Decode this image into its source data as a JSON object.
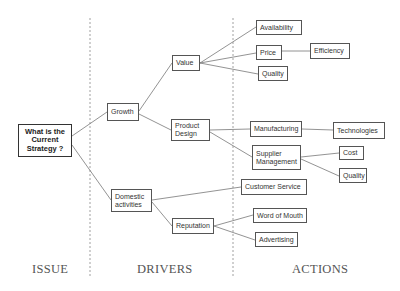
{
  "diagram": {
    "type": "issue-tree",
    "root": "What is the Current Strategy ?",
    "sections": {
      "issue": "ISSUE",
      "drivers": "DRIVERS",
      "actions": "ACTIONS"
    },
    "nodes": {
      "root": "What is the Current Strategy ?",
      "growth": "Growth",
      "domestic": "Domestic activities",
      "value": "Value",
      "product_design": "Product Design",
      "reputation": "Reputation",
      "availability": "Availability",
      "price": "Price",
      "efficiency": "Efficiency",
      "quality1": "Quality",
      "manufacturing": "Manufacturing",
      "technologies": "Technologies",
      "supplier": "Supplier Management",
      "cost": "Cost",
      "quality2": "Quality",
      "customer_service": "Customer Service",
      "word_of_mouth": "Word of Mouth",
      "advertising": "Advertising"
    },
    "edges": [
      [
        "root",
        "growth"
      ],
      [
        "root",
        "domestic"
      ],
      [
        "growth",
        "value"
      ],
      [
        "growth",
        "product_design"
      ],
      [
        "value",
        "availability"
      ],
      [
        "value",
        "price"
      ],
      [
        "value",
        "quality1"
      ],
      [
        "price",
        "efficiency"
      ],
      [
        "product_design",
        "manufacturing"
      ],
      [
        "product_design",
        "supplier"
      ],
      [
        "manufacturing",
        "technologies"
      ],
      [
        "supplier",
        "cost"
      ],
      [
        "supplier",
        "quality2"
      ],
      [
        "domestic",
        "customer_service"
      ],
      [
        "domestic",
        "reputation"
      ],
      [
        "reputation",
        "word_of_mouth"
      ],
      [
        "reputation",
        "advertising"
      ]
    ]
  }
}
